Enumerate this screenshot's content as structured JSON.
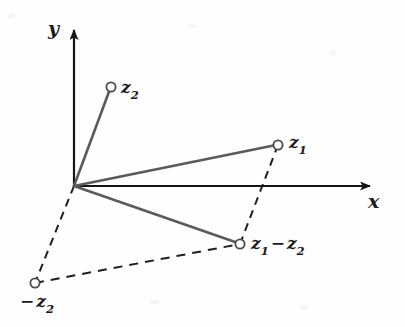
{
  "figure": {
    "background_color": "#fefefe",
    "axis_color": "#151515",
    "vector_color": "#5a5a5a",
    "dashed_color": "#1f1f1f",
    "marker_fill": "#ffffff",
    "marker_stroke": "#4a4a4a"
  },
  "axes": {
    "origin": {
      "x": 74,
      "y": 186
    },
    "x_axis": {
      "label": "x",
      "from": {
        "x": 74,
        "y": 186
      },
      "to": {
        "x": 378,
        "y": 186
      },
      "arrow": true
    },
    "y_axis": {
      "label": "y",
      "from": {
        "x": 74,
        "y": 186
      },
      "to": {
        "x": 74,
        "y": 22
      },
      "arrow": true
    }
  },
  "points": [
    {
      "name": "z2",
      "label_base": "z",
      "label_sub": "2",
      "label_prefix": "",
      "x": 111,
      "y": 87,
      "marker": "open-circle"
    },
    {
      "name": "z1",
      "label_base": "z",
      "label_sub": "1",
      "label_prefix": "",
      "x": 278,
      "y": 145,
      "marker": "open-circle"
    },
    {
      "name": "z1-z2",
      "label_base": "z",
      "label_sub": "1",
      "label_prefix": "",
      "x": 240,
      "y": 244,
      "marker": "open-circle"
    },
    {
      "name": "minus-z2",
      "label_base": "z",
      "label_sub": "2",
      "label_prefix": "−",
      "x": 35,
      "y": 283,
      "marker": "open-circle"
    }
  ],
  "labels": {
    "y_axis": "y",
    "x_axis": "x",
    "z2": {
      "base": "z",
      "sub": "2"
    },
    "z1": {
      "base": "z",
      "sub": "1"
    },
    "z1_minus_z2": {
      "base1": "z",
      "sub1": "1",
      "operator": "−",
      "base2": "z",
      "sub2": "2"
    },
    "minus_z2": {
      "prefix": "−",
      "base": "z",
      "sub": "2"
    }
  },
  "vectors": [
    {
      "name": "vector-to-z2",
      "style": "solid",
      "from": {
        "x": 74,
        "y": 186
      },
      "to": {
        "x": 111,
        "y": 87
      }
    },
    {
      "name": "vector-to-z1",
      "style": "solid",
      "from": {
        "x": 74,
        "y": 186
      },
      "to": {
        "x": 278,
        "y": 145
      }
    },
    {
      "name": "vector-to-z1-z2",
      "style": "solid",
      "from": {
        "x": 74,
        "y": 186
      },
      "to": {
        "x": 240,
        "y": 244
      }
    },
    {
      "name": "vector-to-minus-z2",
      "style": "dashed",
      "from": {
        "x": 74,
        "y": 186
      },
      "to": {
        "x": 35,
        "y": 283
      }
    },
    {
      "name": "parallel-minus-z2-to-difference",
      "style": "dashed",
      "from": {
        "x": 35,
        "y": 283
      },
      "to": {
        "x": 240,
        "y": 244
      }
    },
    {
      "name": "parallel-z1-to-difference",
      "style": "dashed",
      "from": {
        "x": 278,
        "y": 145
      },
      "to": {
        "x": 240,
        "y": 244
      }
    }
  ]
}
